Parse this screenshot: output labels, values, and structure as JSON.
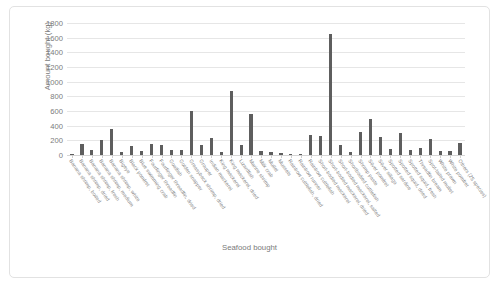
{
  "chart_data": {
    "type": "bar",
    "title": "",
    "xlabel": "Seafood bought",
    "ylabel": "Amount bought (kg)",
    "ylim": [
      0,
      1800
    ],
    "yticks": [
      0,
      200,
      400,
      600,
      800,
      1000,
      1200,
      1400,
      1600,
      1800
    ],
    "grid": true,
    "legend": "none",
    "bar_color": "#5e5e5e",
    "categories": [
      "Banana shrimp, boiled",
      "Banana shrimp, dried",
      "Banana shrimp, fresh",
      "Banana shrimp, medium",
      "Banana shrimp, white",
      "Bigeye",
      "Black pomfret",
      "Blue swimming crab",
      "Fourfinger threadfin",
      "Fourfinger threadfin, dried",
      "Goatfish",
      "Golden snapper",
      "Greasyback shrimp, dried",
      "Grouper",
      "Indian mackerel",
      "King mackerel",
      "King mackerel, dried",
      "Lizardfish",
      "Marine shrimp",
      "Milk crab",
      "Mullet",
      "Mussels",
      "Rainbow cuttlefish, dried",
      "Rainbow runner",
      "Rainbow cuttlefish",
      "Short-bodied mackerel",
      "Short-bodied mackerel, dried",
      "Short-bodied mackerel, salted",
      "Shortbodied cuttlefish",
      "Shrimp paste",
      "Silver pomfret",
      "Silver sillago",
      "Spotted sardine",
      "Spotted squid, dried",
      "Spotted squid, fresh",
      "Threadfin bream",
      "Spot-tailed mullet",
      "White prawn",
      "White pomfret",
      "Others (25 species)"
    ],
    "values": [
      20,
      150,
      70,
      200,
      350,
      40,
      120,
      50,
      150,
      130,
      75,
      70,
      600,
      140,
      230,
      45,
      870,
      130,
      560,
      60,
      35,
      30,
      20,
      15,
      270,
      260,
      1650,
      130,
      40,
      310,
      490,
      250,
      80,
      300,
      70,
      100,
      220,
      50,
      60,
      160
    ]
  }
}
